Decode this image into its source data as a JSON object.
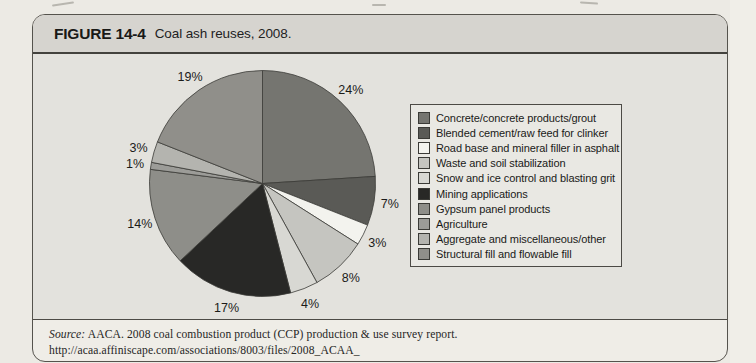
{
  "figure": {
    "label": "FIGURE 14-4",
    "caption": "Coal ash reuses, 2008."
  },
  "source": {
    "prefix": "Source:",
    "line1": "AACA. 2008 coal combustion product (CCP) production & use survey report. http://acaa.affiniscape.com/associations/8003/files/2008_ACAA_",
    "line2": "CCP_Survey_Report_FINAL_100509.pdf. Accessed January 30, 2010."
  },
  "colors": {
    "paper_bg": "#eceae4",
    "box_paper": "#efede7",
    "titlebar_bg": "#d6d4cf",
    "panel_bg": "#e3e2dd",
    "legend_bg": "#e9e8e3",
    "border": "#55534d",
    "slice_stroke": "#3b3b37"
  },
  "chart_data": {
    "type": "pie",
    "title": "Coal ash reuses, 2008",
    "start_angle_deg": 0,
    "direction": "clockwise",
    "legend_position": "right",
    "slices": [
      {
        "label": "Concrete/concrete products/grout",
        "value": 24,
        "pct_label": "24%",
        "color": "#757570"
      },
      {
        "label": "Blended cement/raw feed for clinker",
        "value": 7,
        "pct_label": "7%",
        "color": "#5a5a56"
      },
      {
        "label": "Road base and mineral filler in asphalt",
        "value": 3,
        "pct_label": "3%",
        "color": "#f3f3ee"
      },
      {
        "label": "Waste and soil stabilization",
        "value": 8,
        "pct_label": "8%",
        "color": "#c5c5c0"
      },
      {
        "label": "Snow and ice control and blasting grit",
        "value": 4,
        "pct_label": "4%",
        "color": "#d8d8d3"
      },
      {
        "label": "Mining applications",
        "value": 17,
        "pct_label": "17%",
        "color": "#282826"
      },
      {
        "label": "Gypsum panel products",
        "value": 14,
        "pct_label": "14%",
        "color": "#8e8e89"
      },
      {
        "label": "Agriculture",
        "value": 1,
        "pct_label": "1%",
        "color": "#9c9c98"
      },
      {
        "label": "Aggregate and miscellaneous/other",
        "value": 3,
        "pct_label": "3%",
        "color": "#b4b4af"
      },
      {
        "label": "Structural fill and flowable fill",
        "value": 19,
        "pct_label": "19%",
        "color": "#908f8a"
      }
    ]
  }
}
